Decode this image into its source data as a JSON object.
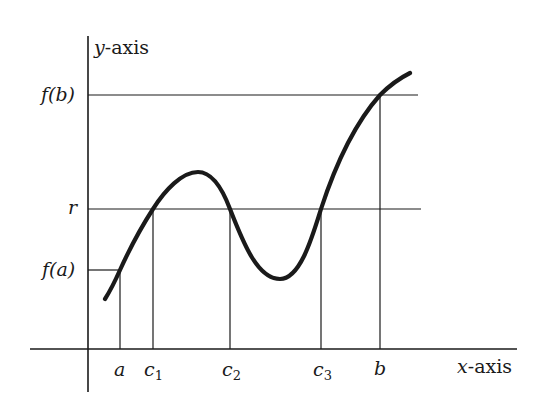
{
  "diagram": {
    "colors": {
      "background": "#ffffff",
      "ink": "#1a1a1a"
    },
    "axes": {
      "y_label_var": "y",
      "y_label_rest": "-axis",
      "x_label_var": "x",
      "x_label_rest": "-axis"
    },
    "y_labels": {
      "fb": "f(b)",
      "r": "r",
      "fa": "f(a)"
    },
    "x_labels": {
      "a": "a",
      "c1_base": "c",
      "c1_sub": "1",
      "c2_base": "c",
      "c2_sub": "2",
      "c3_base": "c",
      "c3_sub": "3",
      "b": "b"
    },
    "geometry": {
      "y_axis_x": 88,
      "x_axis_y": 349,
      "level_fb_y": 95,
      "level_r_y": 209,
      "level_fa_y": 270,
      "x_a": 120,
      "x_c1": 153,
      "x_c2": 230,
      "x_c3": 321,
      "x_b": 380
    }
  }
}
